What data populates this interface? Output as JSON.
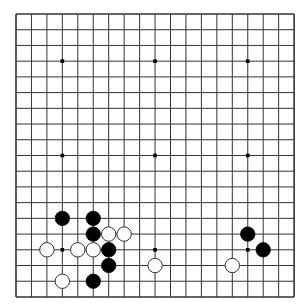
{
  "board": {
    "size": 19,
    "background": "#ffffff",
    "line_color": "#333333",
    "origin_x": 16,
    "origin_y": 14,
    "spacing_x": 15.45,
    "spacing_y": 15.72,
    "stone_radius": 7.2,
    "star_points": [
      [
        3,
        3
      ],
      [
        9,
        3
      ],
      [
        15,
        3
      ],
      [
        3,
        9
      ],
      [
        9,
        9
      ],
      [
        15,
        9
      ],
      [
        3,
        15
      ],
      [
        9,
        15
      ],
      [
        15,
        15
      ]
    ],
    "stones": [
      {
        "color": "black",
        "col": 3,
        "row": 13
      },
      {
        "color": "black",
        "col": 5,
        "row": 13
      },
      {
        "color": "black",
        "col": 5,
        "row": 14
      },
      {
        "color": "white",
        "col": 6,
        "row": 14
      },
      {
        "color": "white",
        "col": 7,
        "row": 14
      },
      {
        "color": "white",
        "col": 2,
        "row": 15
      },
      {
        "color": "white",
        "col": 4,
        "row": 15
      },
      {
        "color": "white",
        "col": 5,
        "row": 15
      },
      {
        "color": "black",
        "col": 6,
        "row": 15
      },
      {
        "color": "black",
        "col": 6,
        "row": 16
      },
      {
        "color": "white",
        "col": 3,
        "row": 17
      },
      {
        "color": "black",
        "col": 5,
        "row": 17
      },
      {
        "color": "white",
        "col": 9,
        "row": 16
      },
      {
        "color": "black",
        "col": 15,
        "row": 14
      },
      {
        "color": "black",
        "col": 16,
        "row": 15
      },
      {
        "color": "white",
        "col": 14,
        "row": 16
      }
    ]
  }
}
